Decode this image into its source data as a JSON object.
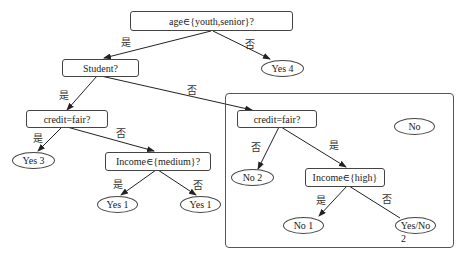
{
  "diagram": {
    "type": "decision-tree",
    "nodes": {
      "root": "age∈{youth,senior}?",
      "yes4": "Yes 4",
      "student": "Student?",
      "credit_left": "credit=fair?",
      "yes3": "Yes 3",
      "income_medium": "Income∈{medium}?",
      "yes1_a": "Yes 1",
      "yes1_b": "Yes 1",
      "credit_right": "credit=fair?",
      "no_box": "No",
      "no2": "No 2",
      "income_high": "Income∈{high}",
      "no1": "No 1",
      "yesno": "Yes/No",
      "yesno_sub": "2"
    },
    "edge_labels": {
      "root_yes": "是",
      "root_no": "否",
      "student_yes": "是",
      "student_no": "否",
      "credit_left_yes": "是",
      "credit_left_no": "否",
      "income_medium_yes": "是",
      "income_medium_no": "否",
      "credit_right_no": "否",
      "credit_right_yes": "是",
      "income_high_yes": "是",
      "income_high_no": "否"
    },
    "edges": [
      [
        "root",
        "student",
        "是"
      ],
      [
        "root",
        "yes4",
        "否"
      ],
      [
        "student",
        "credit_left",
        "是"
      ],
      [
        "student",
        "credit_right",
        "否"
      ],
      [
        "credit_left",
        "yes3",
        "是"
      ],
      [
        "credit_left",
        "income_medium",
        "否"
      ],
      [
        "income_medium",
        "yes1_a",
        "是"
      ],
      [
        "income_medium",
        "yes1_b",
        "否"
      ],
      [
        "credit_right",
        "no2",
        "否"
      ],
      [
        "credit_right",
        "income_high",
        "是"
      ],
      [
        "income_high",
        "no1",
        "是"
      ],
      [
        "income_high",
        "yesno",
        "否"
      ]
    ]
  }
}
